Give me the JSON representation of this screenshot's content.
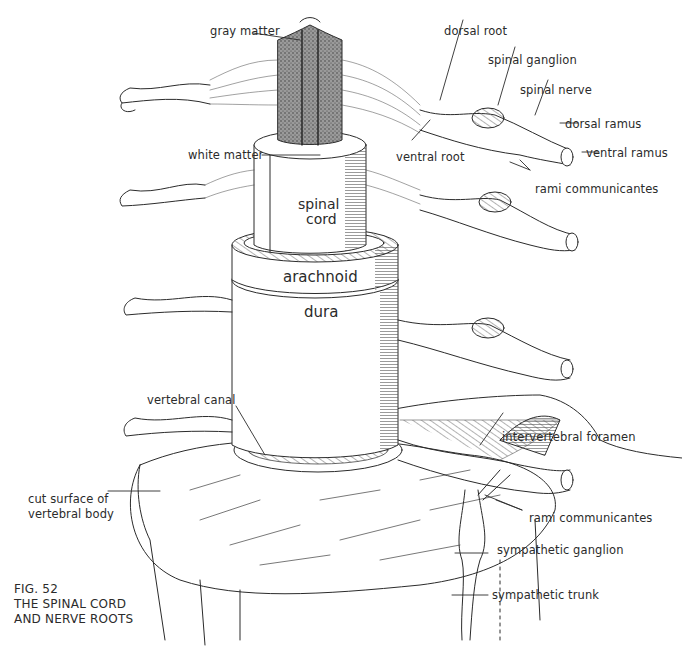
{
  "figure": {
    "number": "FIG. 52",
    "title_line1": "THE SPINAL CORD",
    "title_line2": "AND NERVE ROOTS"
  },
  "labels": {
    "gray_matter": "gray matter",
    "dorsal_root": "dorsal root",
    "spinal_ganglion": "spinal ganglion",
    "spinal_nerve": "spinal nerve",
    "dorsal_ramus": "dorsal ramus",
    "white_matter": "white matter",
    "ventral_root": "ventral root",
    "ventral_ramus": "ventral ramus",
    "rami_communicantes_top": "rami communicantes",
    "vertebral_canal": "vertebral canal",
    "intervertebral_foramen": "intervertebral foramen",
    "cut_surface_line1": "cut surface of",
    "cut_surface_line2": "vertebral body",
    "rami_communicantes_bottom": "rami communicantes",
    "sympathetic_ganglion": "sympathetic ganglion",
    "sympathetic_trunk": "sympathetic trunk"
  },
  "structure_text": {
    "spinal_cord_line1": "spinal",
    "spinal_cord_line2": "cord",
    "arachnoid": "arachnoid",
    "dura": "dura"
  },
  "colors": {
    "ink": "#2b2b2b",
    "paper": "#ffffff"
  }
}
